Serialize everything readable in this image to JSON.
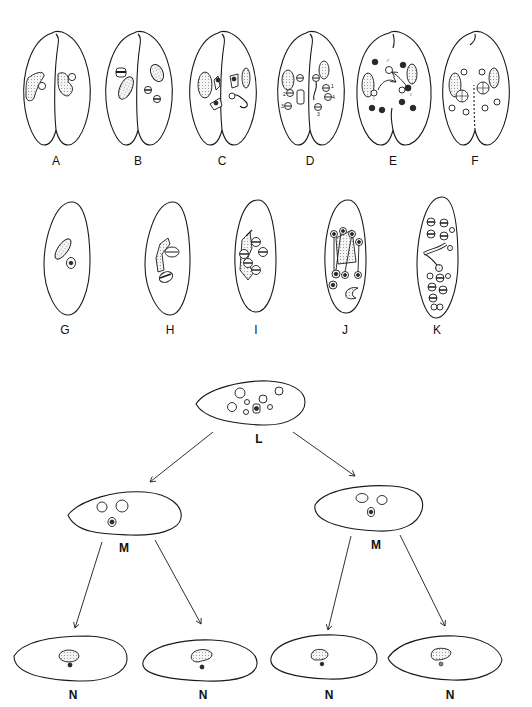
{
  "figure": {
    "title": "",
    "row1": {
      "description": "Conjugating pairs",
      "stages": [
        {
          "label": "A",
          "cx": 56
        },
        {
          "label": "B",
          "cx": 138
        },
        {
          "label": "C",
          "cx": 222
        },
        {
          "label": "D",
          "cx": 310
        },
        {
          "label": "E",
          "cx": 393
        },
        {
          "label": "F",
          "cx": 475
        }
      ]
    },
    "row2": {
      "description": "Exconjugants",
      "stages": [
        {
          "label": "G",
          "cx": 65
        },
        {
          "label": "H",
          "cx": 170
        },
        {
          "label": "I",
          "cx": 256
        },
        {
          "label": "J",
          "cx": 345
        },
        {
          "label": "K",
          "cx": 437
        }
      ]
    },
    "row3": {
      "label": "L"
    },
    "row4": {
      "labels": [
        "M",
        "M"
      ]
    },
    "row5": {
      "labels": [
        "N",
        "N",
        "N",
        "N"
      ]
    },
    "annotations": {
      "male_symbol": "♂",
      "female_symbol": "♀",
      "numbers": [
        "1",
        "2",
        "3",
        "4"
      ]
    }
  }
}
